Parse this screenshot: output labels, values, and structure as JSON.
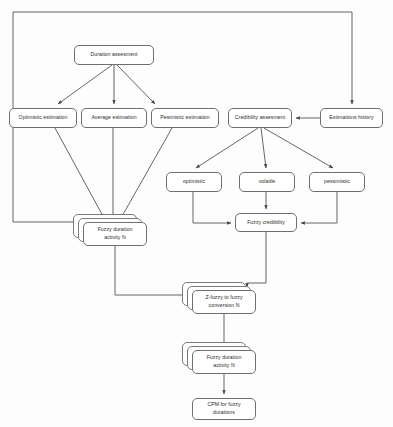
{
  "diagram": {
    "type": "flowchart",
    "frame": {
      "label": "outer-feedback-frame"
    },
    "colors": {
      "node_border": "#6f6f6f",
      "node_fill": "#ffffff",
      "line": "#4a4a4a",
      "background": "#fdfdfd",
      "text": "#2b2b2b"
    },
    "nodes": [
      {
        "id": "duration_assesment",
        "label": "Duration assesment",
        "x": 74,
        "y": 45,
        "w": 80,
        "h": 20,
        "stacked": false
      },
      {
        "id": "optimistic_estimation",
        "label": "Optimistic estimation",
        "x": 9,
        "y": 108,
        "w": 68,
        "h": 20,
        "stacked": false
      },
      {
        "id": "average_estimation",
        "label": "Average estimation",
        "x": 81,
        "y": 108,
        "w": 66,
        "h": 20,
        "stacked": false
      },
      {
        "id": "pesimistic_estimation",
        "label": "Pesimistic estimation",
        "x": 151,
        "y": 108,
        "w": 68,
        "h": 20,
        "stacked": false
      },
      {
        "id": "credibility_assesment",
        "label": "Credibility assesment",
        "x": 228,
        "y": 108,
        "w": 64,
        "h": 20,
        "stacked": false
      },
      {
        "id": "estimations_history",
        "label": "Estimations history",
        "x": 320,
        "y": 108,
        "w": 63,
        "h": 20,
        "stacked": false
      },
      {
        "id": "optimistic",
        "label": "optimistic",
        "x": 166,
        "y": 172,
        "w": 56,
        "h": 20,
        "stacked": false
      },
      {
        "id": "volatile",
        "label": "volatile",
        "x": 239,
        "y": 172,
        "w": 56,
        "h": 20,
        "stacked": false
      },
      {
        "id": "pessimistic",
        "label": "pessimistic",
        "x": 309,
        "y": 172,
        "w": 56,
        "h": 20,
        "stacked": false
      },
      {
        "id": "fuzzy_credibility",
        "label": "Fuzzy credibility",
        "x": 235,
        "y": 213,
        "w": 62,
        "h": 19,
        "stacked": false
      },
      {
        "id": "fuzzy_duration_1",
        "label": "Fuzzy duration\nactivity N",
        "x": 83,
        "y": 222,
        "w": 64,
        "h": 24,
        "stacked": true
      },
      {
        "id": "zfuzzy_conversion",
        "label": "Z-fuzzy to fuzzy\nconversion N",
        "x": 192,
        "y": 290,
        "w": 64,
        "h": 24,
        "stacked": true
      },
      {
        "id": "fuzzy_duration_2",
        "label": "Fuzzy duration\nactivity N",
        "x": 192,
        "y": 350,
        "w": 64,
        "h": 24,
        "stacked": true
      },
      {
        "id": "cpm_fuzzy",
        "label": "CPM for fuzzy\ndurations",
        "x": 192,
        "y": 398,
        "w": 64,
        "h": 22,
        "stacked": false
      }
    ],
    "edges": [
      {
        "from": "duration_assesment",
        "to": "optimistic_estimation",
        "kind": "diagonal-arrow"
      },
      {
        "from": "duration_assesment",
        "to": "average_estimation",
        "kind": "vertical-arrow"
      },
      {
        "from": "duration_assesment",
        "to": "pesimistic_estimation",
        "kind": "diagonal-arrow"
      },
      {
        "from": "optimistic_estimation",
        "to": "fuzzy_duration_1",
        "kind": "diagonal-arrow"
      },
      {
        "from": "average_estimation",
        "to": "fuzzy_duration_1",
        "kind": "vertical-arrow"
      },
      {
        "from": "pesimistic_estimation",
        "to": "fuzzy_duration_1",
        "kind": "diagonal-arrow"
      },
      {
        "from": "estimations_history",
        "to": "credibility_assesment",
        "kind": "horizontal-arrow"
      },
      {
        "from": "credibility_assesment",
        "to": "optimistic",
        "kind": "diagonal-arrow"
      },
      {
        "from": "credibility_assesment",
        "to": "volatile",
        "kind": "vertical-arrow"
      },
      {
        "from": "credibility_assesment",
        "to": "pessimistic",
        "kind": "diagonal-arrow"
      },
      {
        "from": "optimistic",
        "to": "fuzzy_credibility",
        "kind": "elbow-arrow"
      },
      {
        "from": "volatile",
        "to": "fuzzy_credibility",
        "kind": "vertical-arrow"
      },
      {
        "from": "pessimistic",
        "to": "fuzzy_credibility",
        "kind": "elbow-arrow"
      },
      {
        "from": "fuzzy_duration_1",
        "to": "zfuzzy_conversion",
        "kind": "elbow-arrow"
      },
      {
        "from": "fuzzy_credibility",
        "to": "zfuzzy_conversion",
        "kind": "elbow-arrow"
      },
      {
        "from": "zfuzzy_conversion",
        "to": "fuzzy_duration_2",
        "kind": "vertical-arrow"
      },
      {
        "from": "fuzzy_duration_2",
        "to": "cpm_fuzzy",
        "kind": "vertical-arrow"
      },
      {
        "from": "frame-left",
        "to": "fuzzy_duration_1",
        "kind": "feedback-frame"
      },
      {
        "from": "frame-top",
        "to": "estimations_history",
        "kind": "feedback-arrow"
      }
    ]
  }
}
